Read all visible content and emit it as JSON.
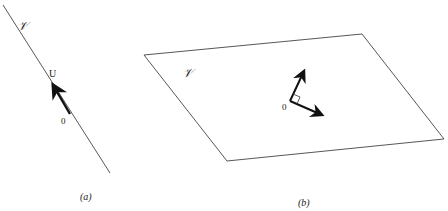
{
  "figure": {
    "panel_a": {
      "caption": "(a)",
      "subspace_label": "𝒱",
      "vector_label": "U",
      "origin_label": "0",
      "line": {
        "x1": 3,
        "y1": 5,
        "x2": 110,
        "y2": 173
      },
      "vector": {
        "x1": 70,
        "y1": 114,
        "x2": 52,
        "y2": 84
      }
    },
    "panel_b": {
      "caption": "(b)",
      "subspace_label": "𝒱",
      "origin_label": "0",
      "plane_points": "144,55 362,34 444,139 227,161",
      "origin": {
        "x": 290,
        "y": 101
      },
      "vector_1": {
        "x2": 305,
        "y2": 69
      },
      "vector_2": {
        "x2": 324,
        "y2": 116
      }
    },
    "colors": {
      "stroke": "#333333",
      "vector": "#111111",
      "background": "#ffffff"
    }
  }
}
